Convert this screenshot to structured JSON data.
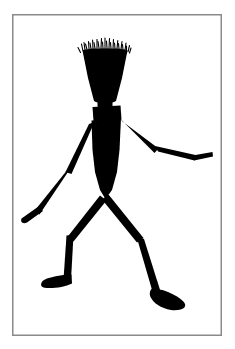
{
  "artwork": {
    "title": "Walking Stick Figure Silhouette",
    "subject": "human-figure",
    "style": "black-silhouette-line-drawing",
    "caption": "",
    "medium": "ink-on-paper"
  },
  "canvas": {
    "width": 235,
    "height": 349,
    "background_color": "#ffffff",
    "ink_color": "#000000"
  },
  "frame": {
    "name": "picture-border",
    "x": 12,
    "y": 14,
    "width": 210,
    "height": 322,
    "stroke_color": "#8a8a8a",
    "stroke_width": 1.5,
    "fill": "none"
  },
  "figure": {
    "name": "stick-figure",
    "fill_color": "#000000",
    "pose": "walking-stride",
    "facing": "right",
    "parts": [
      {
        "name": "hair",
        "type": "spikes",
        "spike_count": 26,
        "span_x": [
          82,
          129
        ],
        "base_y": 50,
        "tip_y_min": 37
      },
      {
        "name": "head",
        "type": "trapezoid",
        "top_width": 46,
        "bottom_width": 16,
        "top_y": 48,
        "bottom_y": 102,
        "center_x": 105
      },
      {
        "name": "neck",
        "type": "block",
        "x": 98,
        "y": 100,
        "width": 15,
        "height": 7
      },
      {
        "name": "collar",
        "type": "block",
        "x": 93,
        "y": 106,
        "width": 28,
        "height": 14
      },
      {
        "name": "torso",
        "type": "tapered-body",
        "shoulder_y": 118,
        "hip_y": 198,
        "shoulder_width": 30,
        "waist_width": 26,
        "hip_width": 4
      },
      {
        "name": "right-upper-arm",
        "type": "limb-segment",
        "from": [
          119,
          120
        ],
        "to": [
          155,
          146
        ],
        "thickness": 7
      },
      {
        "name": "right-forearm",
        "type": "limb-segment",
        "from": [
          155,
          146
        ],
        "to": [
          193,
          158
        ],
        "thickness": 6
      },
      {
        "name": "right-hand",
        "type": "limb-segment",
        "from": [
          193,
          158
        ],
        "to": [
          212,
          154
        ],
        "thickness": 5
      },
      {
        "name": "left-upper-arm",
        "type": "limb-segment",
        "from": [
          92,
          124
        ],
        "to": [
          69,
          170
        ],
        "thickness": 7
      },
      {
        "name": "left-forearm",
        "type": "limb-segment",
        "from": [
          69,
          170
        ],
        "to": [
          36,
          209
        ],
        "thickness": 6
      },
      {
        "name": "left-hand",
        "type": "blob",
        "from": [
          36,
          209
        ],
        "to": [
          22,
          219
        ],
        "thickness": 9
      },
      {
        "name": "left-thigh",
        "type": "limb-segment",
        "from": [
          103,
          198
        ],
        "to": [
          70,
          238
        ],
        "thickness": 8
      },
      {
        "name": "left-shin",
        "type": "limb-segment",
        "from": [
          70,
          238
        ],
        "to": [
          67,
          278
        ],
        "thickness": 7
      },
      {
        "name": "left-foot",
        "type": "wedge",
        "ankle": [
          67,
          278
        ],
        "toe": [
          44,
          285
        ],
        "thickness": 9
      },
      {
        "name": "right-thigh",
        "type": "limb-segment",
        "from": [
          105,
          198
        ],
        "to": [
          140,
          240
        ],
        "thickness": 8
      },
      {
        "name": "right-shin",
        "type": "limb-segment",
        "from": [
          140,
          240
        ],
        "to": [
          157,
          292
        ],
        "thickness": 7
      },
      {
        "name": "right-foot",
        "type": "wedge",
        "ankle": [
          157,
          292
        ],
        "toe": [
          182,
          302
        ],
        "thickness": 13
      }
    ]
  }
}
